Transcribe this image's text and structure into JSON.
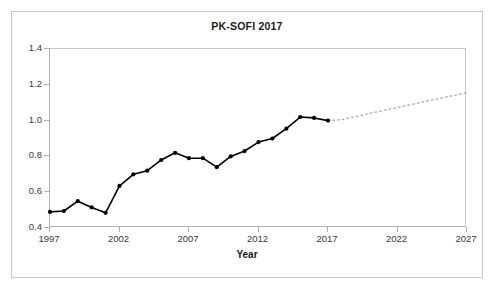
{
  "chart_data": {
    "type": "line",
    "title": "PK-SOFI 2017",
    "xlabel": "Year",
    "ylabel": "",
    "xlim": [
      1997,
      2027
    ],
    "ylim": [
      0.4,
      1.4
    ],
    "grid": false,
    "legend": "none",
    "x_ticks": [
      "1997",
      "2002",
      "2007",
      "2012",
      "2017",
      "2022",
      "2027"
    ],
    "x_tick_values": [
      1997,
      2002,
      2007,
      2012,
      2017,
      2022,
      2027
    ],
    "y_ticks": [
      "0.4",
      "0.6",
      "0.8",
      "1.0",
      "1.2",
      "1.4"
    ],
    "y_tick_values": [
      0.4,
      0.6,
      0.8,
      1.0,
      1.2,
      1.4
    ],
    "marker_color": "#000000",
    "line_color": "#000000",
    "forecast_color": "#b4b4b4",
    "series": [
      {
        "name": "observed",
        "style": "solid-with-markers",
        "x": [
          1997,
          1998,
          1999,
          2000,
          2001,
          2002,
          2003,
          2004,
          2005,
          2006,
          2007,
          2008,
          2009,
          2010,
          2011,
          2012,
          2013,
          2014,
          2015,
          2016,
          2017
        ],
        "values": [
          0.49,
          0.495,
          0.55,
          0.515,
          0.485,
          0.635,
          0.7,
          0.72,
          0.78,
          0.82,
          0.79,
          0.79,
          0.74,
          0.8,
          0.83,
          0.88,
          0.9,
          0.955,
          1.02,
          1.015,
          1.0
        ]
      },
      {
        "name": "forecast",
        "style": "dotted-no-markers",
        "x": [
          2018,
          2019,
          2020,
          2021,
          2022,
          2023,
          2024,
          2025,
          2026,
          2027
        ],
        "values": [
          1.005,
          1.022,
          1.04,
          1.057,
          1.073,
          1.09,
          1.107,
          1.123,
          1.14,
          1.155
        ]
      }
    ]
  }
}
